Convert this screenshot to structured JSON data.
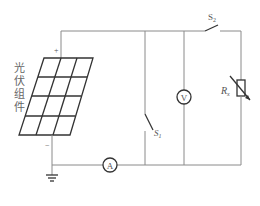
{
  "diagram": {
    "type": "circuit",
    "panel_label_chars": [
      "光",
      "伏",
      "组",
      "件"
    ],
    "plus_sign": "+",
    "minus_sign": "−",
    "components": {
      "ammeter": {
        "symbol": "A"
      },
      "voltmeter": {
        "symbol": "V"
      },
      "switch1": {
        "label": "S",
        "subscript": "1"
      },
      "switch2": {
        "label": "S",
        "subscript": "2"
      },
      "resistor": {
        "label": "R",
        "subscript": "x"
      }
    },
    "colors": {
      "wire": "#8a8a8a",
      "component": "#333333",
      "text": "#555555"
    }
  }
}
